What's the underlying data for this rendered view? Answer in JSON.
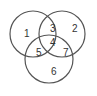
{
  "diagram": {
    "type": "venn",
    "circles": [
      {
        "name": "left",
        "cx": 33,
        "cy": 34,
        "r": 23
      },
      {
        "name": "right",
        "cx": 62,
        "cy": 34,
        "r": 23
      },
      {
        "name": "bottom",
        "cx": 49,
        "cy": 59,
        "r": 24
      }
    ],
    "stroke_color": "#555555",
    "regions": [
      {
        "label": "1",
        "x": 27,
        "y": 33
      },
      {
        "label": "2",
        "x": 72,
        "y": 31
      },
      {
        "label": "3",
        "x": 53,
        "y": 30
      },
      {
        "label": "4",
        "x": 53,
        "y": 45
      },
      {
        "label": "5",
        "x": 40,
        "y": 55
      },
      {
        "label": "6",
        "x": 53,
        "y": 74
      },
      {
        "label": "7",
        "x": 66,
        "y": 55
      }
    ]
  }
}
